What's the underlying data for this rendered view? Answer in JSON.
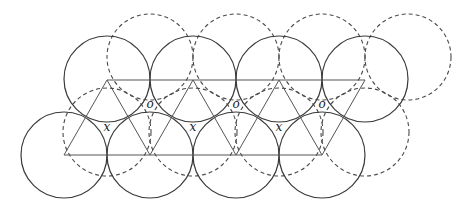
{
  "diagram": {
    "radius": 43,
    "solid_circles": [
      {
        "cx": 107,
        "cy": 79
      },
      {
        "cx": 193,
        "cy": 79
      },
      {
        "cx": 279,
        "cy": 79
      },
      {
        "cx": 365,
        "cy": 79
      },
      {
        "cx": 64,
        "cy": 155
      },
      {
        "cx": 150,
        "cy": 155
      },
      {
        "cx": 236,
        "cy": 155
      },
      {
        "cx": 322,
        "cy": 155
      }
    ],
    "dashed_circles": [
      {
        "cx": 150,
        "cy": 57
      },
      {
        "cx": 236,
        "cy": 57
      },
      {
        "cx": 322,
        "cy": 57
      },
      {
        "cx": 408,
        "cy": 57
      },
      {
        "cx": 107,
        "cy": 132
      },
      {
        "cx": 193,
        "cy": 132
      },
      {
        "cx": 279,
        "cy": 132
      },
      {
        "cx": 365,
        "cy": 132
      }
    ],
    "labels": {
      "x_label": "x",
      "o_label": "o"
    },
    "x_positions": [
      [
        107,
        131
      ],
      [
        193,
        131
      ],
      [
        279,
        131
      ]
    ],
    "o_positions": [
      [
        150,
        108
      ],
      [
        236,
        108
      ],
      [
        322,
        108
      ]
    ]
  }
}
